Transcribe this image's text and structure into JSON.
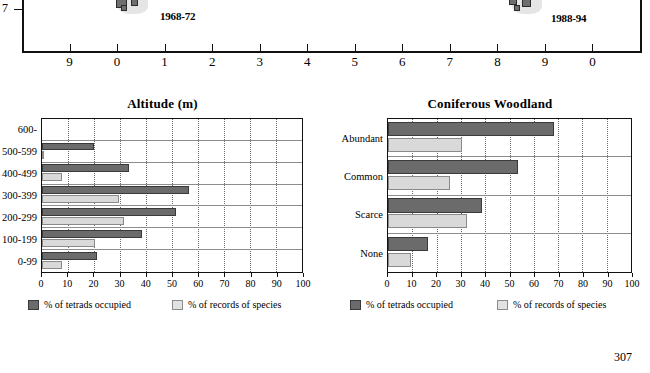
{
  "page": {
    "number": "307"
  },
  "map": {
    "y_axis_label": "7",
    "periods": [
      {
        "label": "1968-72"
      },
      {
        "label": "1988-94"
      }
    ],
    "x_tick_labels": [
      "9",
      "0",
      "1",
      "2",
      "3",
      "4",
      "5",
      "6",
      "7",
      "8",
      "9",
      "0"
    ]
  },
  "legend": {
    "dark_label": "% of tetrads occupied",
    "light_label": "% of records of species",
    "dark_color": "#6b6b6b",
    "light_color": "#d9d9d9"
  },
  "charts": [
    {
      "id": "altitude",
      "chart_data": {
        "type": "bar",
        "title": "Altitude (m)",
        "xlabel": "",
        "ylabel": "",
        "xlim": [
          0,
          100
        ],
        "grid": true,
        "orientation": "horizontal",
        "legend_position": "bottom",
        "categories": [
          "600-",
          "500-599",
          "400-499",
          "300-399",
          "200-299",
          "100-199",
          "0-99"
        ],
        "tick_labels": [
          "0",
          "10",
          "20",
          "30",
          "40",
          "50",
          "60",
          "70",
          "80",
          "90",
          "100"
        ],
        "tick_values": [
          0,
          10,
          20,
          30,
          40,
          50,
          60,
          70,
          80,
          90,
          100
        ],
        "series": [
          {
            "name": "% of tetrads occupied",
            "color": "#6b6b6b",
            "values": [
              0,
              20,
              33.5,
              56.5,
              51.5,
              38.5,
              21
            ]
          },
          {
            "name": "% of records of species",
            "color": "#d9d9d9",
            "values": [
              0,
              0.7,
              7.5,
              29.5,
              31.5,
              20.5,
              7.5
            ]
          }
        ]
      }
    },
    {
      "id": "coniferous-woodland",
      "chart_data": {
        "type": "bar",
        "title": "Coniferous Woodland",
        "xlabel": "",
        "ylabel": "",
        "xlim": [
          0,
          100
        ],
        "grid": true,
        "orientation": "horizontal",
        "legend_position": "bottom",
        "categories": [
          "Abundant",
          "Common",
          "Scarce",
          "None"
        ],
        "tick_labels": [
          "0",
          "10",
          "20",
          "30",
          "40",
          "50",
          "60",
          "70",
          "80",
          "90",
          "100"
        ],
        "tick_values": [
          0,
          10,
          20,
          30,
          40,
          50,
          60,
          70,
          80,
          90,
          100
        ],
        "series": [
          {
            "name": "% of tetrads occupied",
            "color": "#6b6b6b",
            "values": [
              68.5,
              53.5,
              38.5,
              16.5
            ]
          },
          {
            "name": "% of records of species",
            "color": "#d9d9d9",
            "values": [
              30.5,
              25.5,
              32.5,
              9.5
            ]
          }
        ]
      }
    }
  ]
}
